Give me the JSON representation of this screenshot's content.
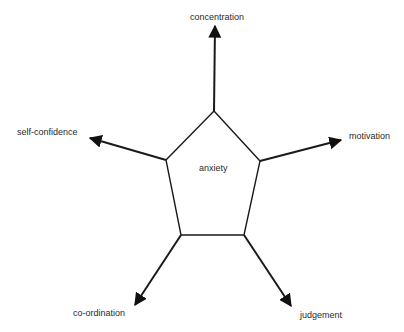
{
  "diagram": {
    "center_label": "anxiety",
    "outputs": [
      {
        "id": "concentration",
        "label": "concentration"
      },
      {
        "id": "motivation",
        "label": "motivation"
      },
      {
        "id": "judgement",
        "label": "judgement"
      },
      {
        "id": "co-ordination",
        "label": "co-ordination"
      },
      {
        "id": "self-confidence",
        "label": "self-confidence"
      }
    ],
    "colors": {
      "stroke": "#1a1a1a",
      "text": "#2a2a2a",
      "background": "#ffffff"
    }
  }
}
